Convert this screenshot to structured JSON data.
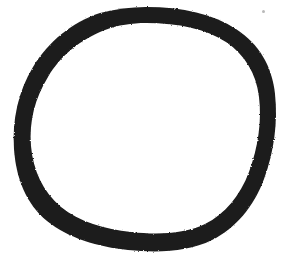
{
  "image": {
    "kind": "hand-drawn-sketch",
    "subject": "circle",
    "description": "A single thick hand-drawn black circle outline on a plain white background",
    "width": 289,
    "height": 263,
    "background_color": "#ffffff",
    "ink_color": "#1a1a1a",
    "text_content": "",
    "has_text": false
  },
  "drawing": {
    "name": "hand-drawn-circle",
    "stroke_color": "#1a1a1a",
    "fill": "none",
    "closed": true,
    "bounding_box": {
      "left": 14,
      "top": 6,
      "right": 275,
      "bottom": 250
    },
    "center": {
      "x": 145,
      "y": 128
    },
    "radius_x": 130,
    "radius_y": 122,
    "stroke_width_min": 8,
    "stroke_width_max": 18,
    "outline_path": "M 146 7 C 183 7 213 14 236 29 C 259 44 272 66 275 94 C 278 122 274 152 264 179 C 254 206 236 228 212 240 C 188 252 158 253 128 250 C 98 247 68 238 47 221 C 26 204 16 178 14 149 C 12 120 18 92 33 67 C 48 42 72 22 100 13 C 115 9 131 7 146 7 Z",
    "inner_path": "M 146 23 C 179 23 206 29 226 42 C 245 55 256 73 259 97 C 262 121 258 148 249 172 C 240 196 225 214 205 224 C 184 234 158 235 131 232 C 105 229 79 222 61 207 C 43 192 33 170 31 146 C 29 121 35 98 48 77 C 60 56 81 39 105 30 C 118 25 132 23 146 23 Z",
    "speck": {
      "name": "ink-speck",
      "x": 262,
      "y": 10,
      "size": 3,
      "color": "#b9b9b9"
    }
  }
}
